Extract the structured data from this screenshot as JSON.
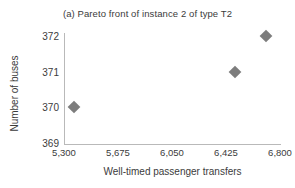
{
  "chart_data": {
    "type": "scatter",
    "title": "(a) Pareto front of instance 2 of type T2",
    "xlabel": "Well-timed passenger transfers",
    "ylabel": "Number of buses",
    "xlim": [
      5300,
      6800
    ],
    "ylim": [
      369,
      372
    ],
    "xticks": [
      5300,
      5675,
      6050,
      6425,
      6800
    ],
    "xticklabels": [
      "5,300",
      "5,675",
      "6,050",
      "6,425",
      "6,800"
    ],
    "yticks": [
      369,
      370,
      371,
      372
    ],
    "yticklabels": [
      "369",
      "370",
      "371",
      "372"
    ],
    "grid": false,
    "legend": null,
    "marker": "diamond",
    "marker_color": "#7d7d7d",
    "axis_color": "#b9b9b9",
    "text_color": "#3b3b3b",
    "points": [
      {
        "x": 5370,
        "y": 370
      },
      {
        "x": 6490,
        "y": 371
      },
      {
        "x": 6700,
        "y": 372
      }
    ]
  }
}
